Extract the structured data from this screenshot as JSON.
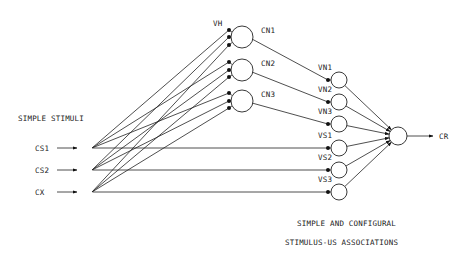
{
  "diagram": {
    "title_left": "SIMPLE STIMULI",
    "caption_line1": "SIMPLE AND CONFIGURAL",
    "caption_line2": "STIMULUS-US ASSOCIATIONS",
    "vh_label": "VH",
    "output_label": "CR",
    "inputs": [
      {
        "id": "cs1",
        "label": "CS1",
        "x": 85,
        "y": 148
      },
      {
        "id": "cs2",
        "label": "CS2",
        "x": 85,
        "y": 170
      },
      {
        "id": "cx",
        "label": "CX",
        "x": 85,
        "y": 192
      }
    ],
    "configural_nodes": [
      {
        "id": "cn1",
        "label": "CN1",
        "x": 242,
        "y": 37,
        "dots_y": [
          30,
          37,
          45
        ]
      },
      {
        "id": "cn2",
        "label": "CN2",
        "x": 242,
        "y": 70,
        "dots_y": [
          62,
          70,
          77
        ]
      },
      {
        "id": "cn3",
        "label": "CN3",
        "x": 242,
        "y": 101,
        "dots_y": [
          93,
          101,
          108
        ]
      }
    ],
    "association_nodes": [
      {
        "id": "vn1",
        "label": "VN1",
        "x": 339,
        "y": 80,
        "source": "cn1"
      },
      {
        "id": "vn2",
        "label": "VN2",
        "x": 339,
        "y": 102,
        "source": "cn2"
      },
      {
        "id": "vn3",
        "label": "VN3",
        "x": 339,
        "y": 124,
        "source": "cn3"
      },
      {
        "id": "vs1",
        "label": "VS1",
        "x": 339,
        "y": 148,
        "source": "cs1"
      },
      {
        "id": "vs2",
        "label": "VS2",
        "x": 339,
        "y": 170,
        "source": "cs2"
      },
      {
        "id": "vs3",
        "label": "VS3",
        "x": 339,
        "y": 192,
        "source": "cx"
      }
    ],
    "output_node": {
      "id": "cr",
      "x": 398,
      "y": 136
    },
    "colors": {
      "line": "#222222",
      "background": "#ffffff"
    }
  }
}
